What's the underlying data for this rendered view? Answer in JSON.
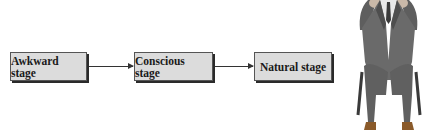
{
  "diagram": {
    "type": "flowchart",
    "direction": "left-to-right",
    "stages": [
      {
        "label": "Awkward stage"
      },
      {
        "label": "Conscious stage"
      },
      {
        "label": "Natural stage"
      }
    ],
    "connections": [
      {
        "from": "Awkward stage",
        "to": "Conscious stage"
      },
      {
        "from": "Conscious stage",
        "to": "Natural stage"
      }
    ],
    "colors": {
      "box_fill": "#dcdcdc",
      "box_border": "#2a2a2a",
      "arrow": "#333333"
    }
  },
  "illustration": {
    "subject": "man-in-suit-seated-on-chair-hands-on-head"
  }
}
